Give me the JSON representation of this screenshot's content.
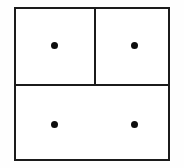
{
  "figure": {
    "name": "partitioned-rectangle-with-points",
    "background_color": "#ffffff",
    "canvas_color": "#fefefe",
    "line_color": "#1b1b1b",
    "dot_color": "#0d0d0d",
    "line_width_px": 2,
    "width_px": 184,
    "height_px": 168
  },
  "outer_rectangle": {
    "label": "",
    "x": 14,
    "y": 7,
    "width": 156,
    "height": 154
  },
  "dividers": [
    {
      "name": "horizontal-divider",
      "orientation": "horizontal",
      "x": 14,
      "y": 84,
      "length": 156
    },
    {
      "name": "vertical-divider",
      "orientation": "vertical",
      "x": 94,
      "y": 7,
      "length": 79
    }
  ],
  "cells": [
    {
      "name": "top-left-cell",
      "label": "",
      "dot_count": 1
    },
    {
      "name": "top-right-cell",
      "label": "",
      "dot_count": 1
    },
    {
      "name": "bottom-cell",
      "label": "",
      "dot_count": 2
    }
  ],
  "dots": [
    {
      "name": "dot-top-left",
      "cx": 54,
      "cy": 45,
      "r": 3.5
    },
    {
      "name": "dot-top-right",
      "cx": 134,
      "cy": 45,
      "r": 3.5
    },
    {
      "name": "dot-bottom-left",
      "cx": 54,
      "cy": 124,
      "r": 3.5
    },
    {
      "name": "dot-bottom-right",
      "cx": 134,
      "cy": 124,
      "r": 3.5
    }
  ],
  "chart_data": {
    "type": "diagram",
    "title": "",
    "regions": 3,
    "total_points": 4,
    "points_per_region": [
      1,
      1,
      2
    ]
  }
}
